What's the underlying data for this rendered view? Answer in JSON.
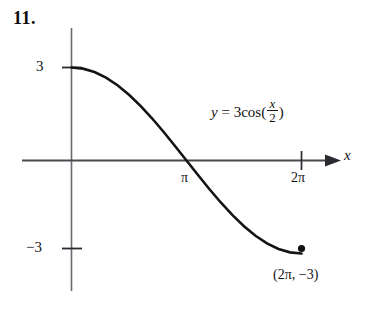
{
  "figure": {
    "problem_number": "11.",
    "equation": {
      "lhs": "y",
      "equals": "=",
      "coefficient_function": "3cos(",
      "numerator": "x",
      "denominator": "2",
      "closing": ")"
    },
    "point_label": "(2π, −3)",
    "axis_name_x": "x",
    "colors": {
      "background": "#ffffff",
      "curve": "#141414",
      "axis": "#5a5a60",
      "text": "#131313"
    }
  },
  "chart_data": {
    "type": "line",
    "title": "",
    "subtitle": "",
    "xlabel": "x",
    "ylabel": "",
    "grid": false,
    "legend": null,
    "annotations": [
      {
        "text": "y = 3cos(x/2)",
        "x": 3.14,
        "y": 2.0
      },
      {
        "text": "(2π, −3)",
        "x": 6.28,
        "y": -3.6
      }
    ],
    "xlim": [
      -1.3,
      7.6
    ],
    "ylim": [
      -4.6,
      4.6
    ],
    "xticks": [
      3.141592653589793,
      6.283185307179586
    ],
    "xtick_labels": [
      "π",
      "2π"
    ],
    "yticks": [
      3,
      -3
    ],
    "ytick_labels": [
      "3",
      "−3"
    ],
    "series": [
      {
        "name": "y = 3cos(x/2)",
        "x": [
          0.0,
          0.3141592653589793,
          0.6283185307179586,
          0.9424777960769379,
          1.2566370614359172,
          1.5707963267948966,
          1.8849555921538759,
          2.199114857512855,
          2.5132741228718345,
          2.827433388230814,
          3.141592653589793,
          3.455751918948772,
          3.7699111843077517,
          4.084070449666731,
          4.39822971502571,
          4.71238898038469,
          5.026548245743669,
          5.340707511102648,
          5.654866776461628,
          5.969026041820607,
          6.283185307179586
        ],
        "y": [
          3.0,
          2.963,
          2.853,
          2.674,
          2.427,
          2.121,
          1.763,
          1.362,
          0.927,
          0.469,
          0.0,
          -0.469,
          -0.927,
          -1.362,
          -1.763,
          -2.121,
          -2.427,
          -2.674,
          -2.853,
          -2.963,
          -3.0
        ]
      }
    ],
    "markers": [
      {
        "x": 6.283185307179586,
        "y": -3.0,
        "style": "filled-circle",
        "label": "(2π, −3)"
      }
    ]
  }
}
